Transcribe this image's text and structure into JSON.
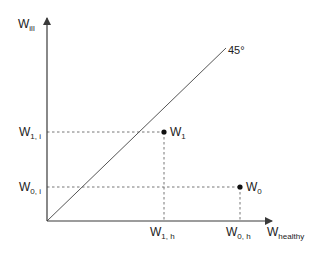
{
  "diagram": {
    "type": "indifference-state-diagram",
    "colors": {
      "axis": "#3a3a3a",
      "line45": "#555555",
      "dashed": "#777777",
      "point": "#111111",
      "text": "#222222"
    },
    "axes": {
      "y_label": {
        "main": "W",
        "sub": "ill"
      },
      "x_label": {
        "main": "W",
        "sub": "healthy"
      }
    },
    "diagonal": {
      "label": "45°"
    },
    "points": [
      {
        "id": "W1",
        "label_main": "W",
        "label_sub": "1",
        "x_tick": {
          "main": "W",
          "sub": "1, h"
        },
        "y_tick": {
          "main": "W",
          "sub": "1, i"
        }
      },
      {
        "id": "W0",
        "label_main": "W",
        "label_sub": "0",
        "x_tick": {
          "main": "W",
          "sub": "0, h"
        },
        "y_tick": {
          "main": "W",
          "sub": "0, i"
        }
      }
    ]
  }
}
